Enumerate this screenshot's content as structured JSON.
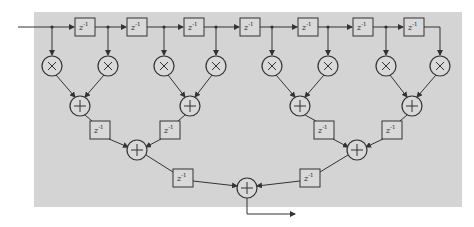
{
  "diagram": {
    "type": "pipelined FIR filter (tree adder structure)",
    "delay_label": "z",
    "delay_exp": "-1",
    "multiplier_symbol": "×",
    "adder_symbol": "+",
    "colors": {
      "panel": "#d4d4d4",
      "stroke": "#333333",
      "background": "#ffffff"
    },
    "input_delays": 7,
    "multipliers": 8,
    "adders_level1": 4,
    "adders_level2": 2,
    "adders_level3": 1
  }
}
